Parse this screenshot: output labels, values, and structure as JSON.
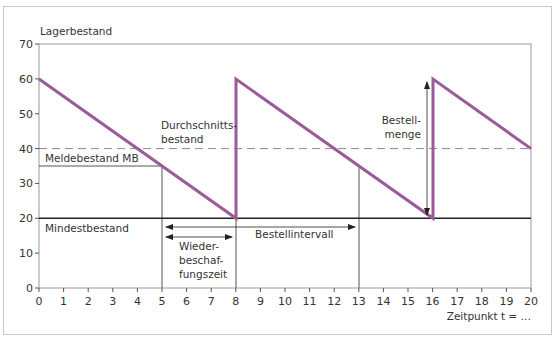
{
  "chart_data": {
    "type": "line",
    "title": "",
    "xlabel": "Zeitpunkt t = …",
    "ylabel": "Lagerbestand",
    "xlim": [
      0,
      20
    ],
    "ylim": [
      0,
      70
    ],
    "x_ticks": [
      0,
      1,
      2,
      3,
      4,
      5,
      6,
      7,
      8,
      9,
      10,
      11,
      12,
      13,
      14,
      15,
      16,
      17,
      18,
      19,
      20
    ],
    "y_ticks": [
      0,
      10,
      20,
      30,
      40,
      50,
      60,
      70
    ],
    "grid": false,
    "series": [
      {
        "name": "Lagerbestand",
        "color": "#9b5a9b",
        "points": [
          [
            0,
            60
          ],
          [
            8,
            20
          ],
          [
            8,
            60
          ],
          [
            16,
            20
          ],
          [
            16,
            60
          ],
          [
            20,
            40
          ]
        ]
      }
    ],
    "reference_lines": [
      {
        "name": "Durchschnittsbestand",
        "y": 40,
        "style": "dashed",
        "color": "#888888"
      },
      {
        "name": "Meldebestand MB",
        "y": 35,
        "x_range": [
          0,
          5
        ],
        "style": "solid",
        "color": "#555555"
      },
      {
        "name": "Mindestbestand",
        "y": 20,
        "style": "solid",
        "color": "#222222"
      }
    ],
    "vertical_markers": [
      {
        "x": 5,
        "y_range": [
          0,
          35
        ]
      },
      {
        "x": 13,
        "y_range": [
          0,
          35
        ]
      }
    ],
    "annotations": [
      {
        "text": "Meldebestand MB",
        "x": 0.3,
        "y": 37.5
      },
      {
        "text": "Mindestbestand",
        "x": 0.3,
        "y": 17
      },
      {
        "text": "Durchschnitts-\nbestand",
        "x": 6.1,
        "y": 46
      },
      {
        "text": "Bestell-\nmenge",
        "x": 14.2,
        "y": 45
      },
      {
        "text": "Wieder-\nbeschaf-\nfungszeit",
        "x": 5.6,
        "y": 12
      },
      {
        "text": "Bestellintervall",
        "x": 9.5,
        "y": 15
      }
    ],
    "arrows": [
      {
        "name": "Bestellintervall",
        "from": [
          5,
          17
        ],
        "to": [
          13,
          17
        ],
        "double": true
      },
      {
        "name": "Wiederbeschaffungszeit",
        "from": [
          5,
          13.5
        ],
        "to": [
          8,
          13.5
        ],
        "double": true
      },
      {
        "name": "Bestellmenge",
        "from": [
          15.7,
          20
        ],
        "to": [
          15.7,
          60
        ],
        "double": true
      }
    ]
  },
  "labels": {
    "ylabel": "Lagerbestand",
    "xlabel": "Zeitpunkt t = …",
    "meldebestand": "Meldebestand MB",
    "mindestbestand": "Mindestbestand",
    "durchschnitt_1": "Durchschnitts-",
    "durchschnitt_2": "bestand",
    "bestellmenge_1": "Bestell-",
    "bestellmenge_2": "menge",
    "wbz_1": "Wieder-",
    "wbz_2": "beschaf-",
    "wbz_3": "fungszeit",
    "bestellintervall": "Bestellintervall"
  },
  "ticks": {
    "x": [
      "0",
      "1",
      "2",
      "3",
      "4",
      "5",
      "6",
      "7",
      "8",
      "9",
      "10",
      "11",
      "12",
      "13",
      "14",
      "15",
      "16",
      "17",
      "18",
      "19",
      "20"
    ],
    "y": [
      "0",
      "10",
      "20",
      "30",
      "40",
      "50",
      "60",
      "70"
    ]
  },
  "colors": {
    "series": "#9b5a9b",
    "axis": "#333333",
    "dashed": "#8a8a8a"
  }
}
